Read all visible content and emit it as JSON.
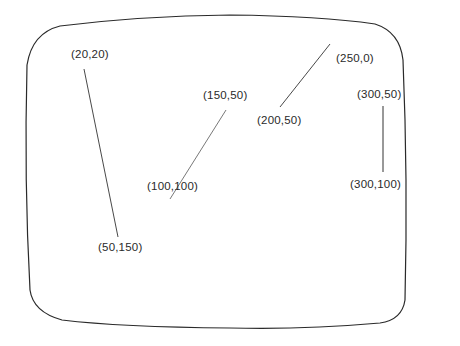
{
  "diagram": {
    "colors": {
      "stroke": "#2a2a2a",
      "background": "#ffffff"
    },
    "segments": [
      {
        "id": "segment-1",
        "from": "(20,20)",
        "to": "(50,150)"
      },
      {
        "id": "segment-2",
        "from": "(150,50)",
        "to": "(100,100)"
      },
      {
        "id": "segment-3",
        "from": "(250,0)",
        "to": "(200,50)"
      },
      {
        "id": "segment-4",
        "from": "(300,50)",
        "to": "(300,100)"
      }
    ],
    "labels": {
      "p20_20": "(20,20)",
      "p50_150": "(50,150)",
      "p150_50": "(150,50)",
      "p100_100": "(100,100)",
      "p250_0": "(250,0)",
      "p200_50": "(200,50)",
      "p300_50": "(300,50)",
      "p300_100": "(300,100)"
    }
  }
}
